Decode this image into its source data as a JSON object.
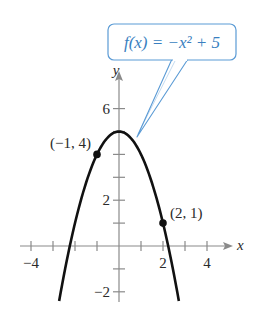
{
  "chart_data": {
    "type": "line",
    "title": "",
    "function_label": "f(x) = −x² + 5",
    "function": {
      "a": -1,
      "b": 0,
      "c": 5
    },
    "xlabel": "x",
    "ylabel": "y",
    "xlim": [
      -4.8,
      5
    ],
    "ylim": [
      -2.4,
      7
    ],
    "x_ticks": [
      -4,
      -3,
      -2,
      -1,
      0,
      1,
      2,
      3,
      4
    ],
    "y_ticks": [
      -2,
      -1,
      1,
      2,
      3,
      4,
      5,
      6
    ],
    "x_tick_labels": [
      {
        "value": -4,
        "text": "−4"
      },
      {
        "value": 2,
        "text": "2"
      },
      {
        "value": 4,
        "text": "4"
      }
    ],
    "y_tick_labels": [
      {
        "value": 6,
        "text": "6"
      },
      {
        "value": 2,
        "text": "2"
      },
      {
        "value": -2,
        "text": "−2"
      }
    ],
    "points": [
      {
        "x": -1,
        "y": 4,
        "label": "(−1, 4)"
      },
      {
        "x": 2,
        "y": 1,
        "label": "(2, 1)"
      }
    ],
    "vertex": {
      "x": 0,
      "y": 5
    },
    "grid": false,
    "legend": "callout box top-right",
    "colors": {
      "curve": "#111111",
      "axes": "#8a8a8a",
      "callout": "#5b9bd5",
      "callout_text": "#3a7fc0"
    }
  }
}
